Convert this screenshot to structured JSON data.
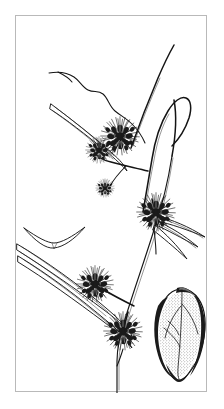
{
  "figure": {
    "domain_kind": "botanical-line-illustration",
    "title": "",
    "caption": "",
    "frame": {
      "border_color": "#b9b9b9",
      "background_color": "#ffffff",
      "x": 15,
      "y": 15,
      "width": 192,
      "height": 377
    },
    "canvas": {
      "width": 224,
      "height": 409,
      "background_color": "#ffffff"
    },
    "ink_color": "#111111",
    "style": "pen-and-ink stipple line drawing, black on white, no labels or text"
  },
  "subject": {
    "common_description": "sedge-like plant (Scirpus / Cyperaceae) branching inflorescence with bur-like spherical spikelet clusters",
    "parts": [
      {
        "id": "main-culm",
        "label": "main stem (culm)",
        "note": "thick three-sided stem rising from bottom centre to upper right"
      },
      {
        "id": "branch-upper",
        "label": "upper flowering branch"
      },
      {
        "id": "branch-arching",
        "label": "arching bare branch loop, right side"
      },
      {
        "id": "branch-left",
        "label": "left side branch"
      },
      {
        "id": "bract-leaf-long",
        "label": "long linear bract leaf sweeping to lower left"
      },
      {
        "id": "bract-leaf-right",
        "label": "narrow bract leaves at right spikelet head"
      },
      {
        "id": "scale-detail",
        "label": "detached floral scale, left middle"
      },
      {
        "id": "achene-detail",
        "label": "enlarged achene / nutlet, lower right"
      }
    ],
    "flower_heads": [
      {
        "id": "head-1",
        "position": "upper centre",
        "cx": 104,
        "cy": 120,
        "r": 19,
        "size": "large"
      },
      {
        "id": "head-2",
        "position": "upper centre-left",
        "cx": 83,
        "cy": 134,
        "r": 13,
        "size": "medium"
      },
      {
        "id": "head-3",
        "position": "mid left small",
        "cx": 89,
        "cy": 172,
        "r": 9,
        "size": "small"
      },
      {
        "id": "head-4",
        "position": "mid right",
        "cx": 140,
        "cy": 196,
        "r": 19,
        "size": "large"
      },
      {
        "id": "head-5",
        "position": "lower left",
        "cx": 79,
        "cy": 268,
        "r": 18,
        "size": "large"
      },
      {
        "id": "head-6",
        "position": "lower centre",
        "cx": 107,
        "cy": 315,
        "r": 19,
        "size": "large"
      }
    ]
  },
  "details": {
    "scale": {
      "id": "scale-detail",
      "shape": "shallow crescent / boat-shaped glume seen edge-on",
      "cx": 38,
      "cy": 218,
      "width": 60,
      "height": 16
    },
    "achene": {
      "id": "achene-detail",
      "shape": "ovoid three-angled nutlet with beak, stippled shading, dark left and right margins",
      "cx": 166,
      "cy": 315,
      "width": 46,
      "height": 84
    }
  },
  "palette": {
    "ink": "#111111",
    "ink_soft": "#4a4a4a",
    "shade": "#6d6d6d",
    "paper": "#ffffff",
    "frame": "#b9b9b9"
  }
}
